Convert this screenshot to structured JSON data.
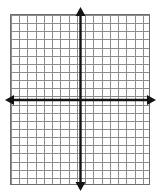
{
  "figure": {
    "name": "blank-cartesian-coordinate-grid",
    "title": "",
    "background_color": "#ffffff"
  },
  "chart_data": {
    "type": "scatter",
    "title": "",
    "subtitle": "",
    "xlabel": "",
    "ylabel": "",
    "x": [],
    "y": [],
    "series": [],
    "categories": [],
    "values": [],
    "xlim": [
      -8.5,
      8.5
    ],
    "ylim": [
      -10.5,
      10.5
    ],
    "x_tick_labels": [],
    "y_tick_labels": [],
    "grid": true,
    "grid_columns": 17,
    "grid_rows": 21,
    "cell_size_px": 8,
    "legend": "none",
    "annotations": [],
    "axes": {
      "x_axis": {
        "name": "x-axis",
        "orientation": "horizontal",
        "double_headed": true,
        "left_arrow": true,
        "right_arrow": true
      },
      "y_axis": {
        "name": "y-axis",
        "orientation": "vertical",
        "double_headed": true,
        "up_arrow": true,
        "down_arrow": true
      },
      "origin": {
        "x": 80,
        "y": 100
      }
    }
  },
  "colors": {
    "grid_line": "#8c8c8c",
    "grid_border": "#6e6e6e",
    "axis": "#141414",
    "plot_background": "#ffffff"
  },
  "geometry": {
    "grid_left": 10,
    "grid_top": 14,
    "grid_width": 140,
    "grid_height": 171,
    "x_axis_y": 100,
    "y_axis_x": 80,
    "left_arrow_tip_x": 5,
    "right_arrow_tip_x": 156,
    "top_arrow_tip_y": 7,
    "bottom_arrow_tip_y": 191
  }
}
